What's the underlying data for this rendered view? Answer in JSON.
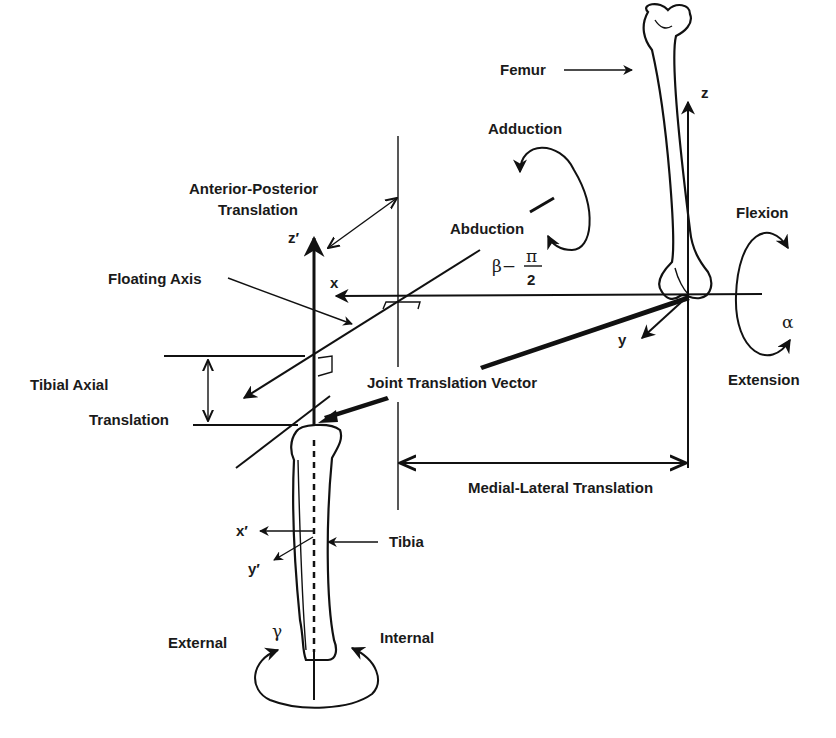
{
  "figure": {
    "colors": {
      "ink": "#111111",
      "background": "#ffffff"
    },
    "bones": {
      "femur": "Femur",
      "tibia": "Tibia"
    },
    "axes": {
      "femoral": {
        "z": "z",
        "x": "x",
        "y": "y"
      },
      "tibial": {
        "z": "z′",
        "x": "x′",
        "y": "y′"
      },
      "floating": "Floating Axis"
    },
    "rotations": {
      "flexion": "Flexion",
      "extension": "Extension",
      "alpha": "α",
      "adduction": "Adduction",
      "abduction": "Abduction",
      "beta_prefix": "β−",
      "beta_num": "π",
      "beta_den": "2",
      "external": "External",
      "internal": "Internal",
      "gamma": "γ"
    },
    "translations": {
      "anterior_posterior_line1": "Anterior-Posterior",
      "anterior_posterior_line2": "Translation",
      "tibial_axial_line1": "Tibial Axial",
      "tibial_axial_line2": "Translation",
      "joint_vector": "Joint Translation Vector",
      "medial_lateral": "Medial-Lateral Translation"
    }
  }
}
